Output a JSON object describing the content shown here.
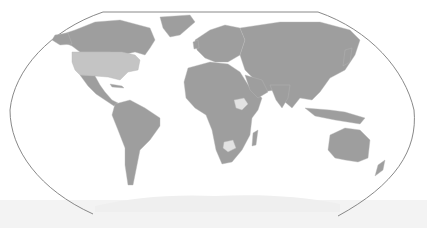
{
  "map": {
    "projection": "Robinson (world)",
    "style": "greyscale",
    "colors": {
      "background": "#ffffff",
      "land": "#9e9e9e",
      "borders": "#b8b8b8",
      "highlight_light": "#c4c4c4",
      "highlight_pale": "#e2e2e2",
      "frame": "#7a7a7a",
      "antarctica": "#efefef"
    },
    "highlighted_regions": [
      {
        "name": "United States",
        "shade": "light"
      },
      {
        "name": "Ethiopia",
        "shade": "pale"
      },
      {
        "name": "Zimbabwe",
        "shade": "pale"
      }
    ],
    "labels": []
  }
}
